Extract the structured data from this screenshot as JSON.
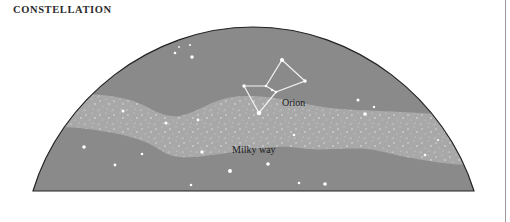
{
  "header": {
    "title": "CONSTELLATION"
  },
  "diagram": {
    "labels": {
      "orion": "Orion",
      "milky_way": "Milky way"
    },
    "colors": {
      "sky": "#8a8a8a",
      "milky_way": "#a6a6a6",
      "outline": "#222222",
      "star": "#ffffff",
      "rule": "#9a9a9a"
    }
  }
}
